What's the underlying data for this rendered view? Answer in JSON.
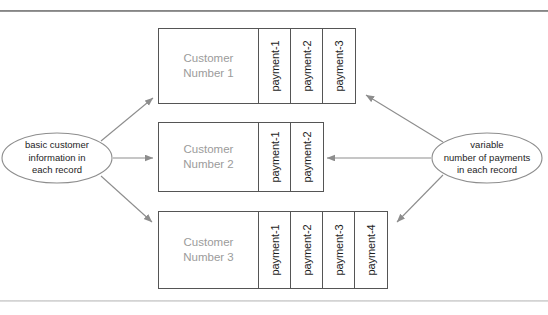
{
  "diagram": {
    "rules": {
      "top_label": "top-divider",
      "bottom_label": "bottom-divider"
    },
    "left_node": {
      "lines": [
        "basic customer",
        "information in",
        "each record"
      ]
    },
    "right_node": {
      "lines": [
        "variable",
        "number of payments",
        "in each record"
      ]
    },
    "records": [
      {
        "customer_lines": [
          "Customer",
          "Number 1"
        ],
        "payments": [
          "payment-1",
          "payment-2",
          "payment-3"
        ]
      },
      {
        "customer_lines": [
          "Customer",
          "Number 2"
        ],
        "payments": [
          "payment-1",
          "payment-2"
        ]
      },
      {
        "customer_lines": [
          "Customer",
          "Number 3"
        ],
        "payments": [
          "payment-1",
          "payment-2",
          "payment-3",
          "payment-4"
        ]
      }
    ],
    "colors": {
      "box_border": "#555555",
      "connector": "#8d8d8d",
      "customer_text": "#9b9b9b",
      "payment_text": "#1d1d1d",
      "rule_top": "#8a8a8a",
      "rule_bottom": "#d5d5d5",
      "background": "#ffffff"
    }
  }
}
